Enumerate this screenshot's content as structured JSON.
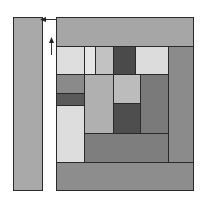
{
  "diagram": {
    "type": "block-composition",
    "strip": {
      "x": 13,
      "y": 17,
      "w": 30,
      "h": 174,
      "color": "#a9a9a9"
    },
    "arrows": [
      {
        "name": "arrow-left-icon",
        "x": 40,
        "y": 8,
        "w": 17,
        "h": 7,
        "direction": "left"
      },
      {
        "name": "arrow-up-icon",
        "x": 48,
        "y": 37,
        "w": 7,
        "h": 18,
        "direction": "up"
      }
    ],
    "blocks": [
      {
        "name": "top-band",
        "x": 56,
        "y": 17,
        "w": 138,
        "h": 30,
        "color": "#a6a6a6"
      },
      {
        "name": "right-band",
        "x": 168,
        "y": 46,
        "w": 26,
        "h": 117,
        "color": "#8b8b8b"
      },
      {
        "name": "bottom-band",
        "x": 56,
        "y": 162,
        "w": 138,
        "h": 29,
        "color": "#8d8d8d"
      },
      {
        "name": "block-r1-a",
        "x": 56,
        "y": 46,
        "w": 29,
        "h": 29,
        "color": "#dedede"
      },
      {
        "name": "block-r1-b",
        "x": 84,
        "y": 46,
        "w": 12,
        "h": 29,
        "color": "#e6e6e6"
      },
      {
        "name": "block-r1-c",
        "x": 95,
        "y": 46,
        "w": 19,
        "h": 29,
        "color": "#c2c2c2"
      },
      {
        "name": "block-r1-d",
        "x": 113,
        "y": 46,
        "w": 23,
        "h": 29,
        "color": "#4a4a4a"
      },
      {
        "name": "block-r1-e",
        "x": 135,
        "y": 46,
        "w": 34,
        "h": 29,
        "color": "#dcdcdc"
      },
      {
        "name": "block-l-gray",
        "x": 56,
        "y": 74,
        "w": 29,
        "h": 20,
        "color": "#8a8a8a"
      },
      {
        "name": "block-l-dark",
        "x": 56,
        "y": 93,
        "w": 29,
        "h": 13,
        "color": "#5a5a5a"
      },
      {
        "name": "block-l-light",
        "x": 56,
        "y": 105,
        "w": 29,
        "h": 58,
        "color": "#dddddd"
      },
      {
        "name": "block-mid-tall",
        "x": 84,
        "y": 74,
        "w": 30,
        "h": 60,
        "color": "#b0b0b0"
      },
      {
        "name": "block-mid-light",
        "x": 113,
        "y": 74,
        "w": 28,
        "h": 30,
        "color": "#bcbcbc"
      },
      {
        "name": "block-mid-dark",
        "x": 113,
        "y": 103,
        "w": 28,
        "h": 31,
        "color": "#4e4e4e"
      },
      {
        "name": "block-right-gray",
        "x": 140,
        "y": 74,
        "w": 29,
        "h": 60,
        "color": "#7a7a7a"
      },
      {
        "name": "block-lower-band",
        "x": 84,
        "y": 133,
        "w": 85,
        "h": 30,
        "color": "#7e7e7e"
      }
    ]
  }
}
